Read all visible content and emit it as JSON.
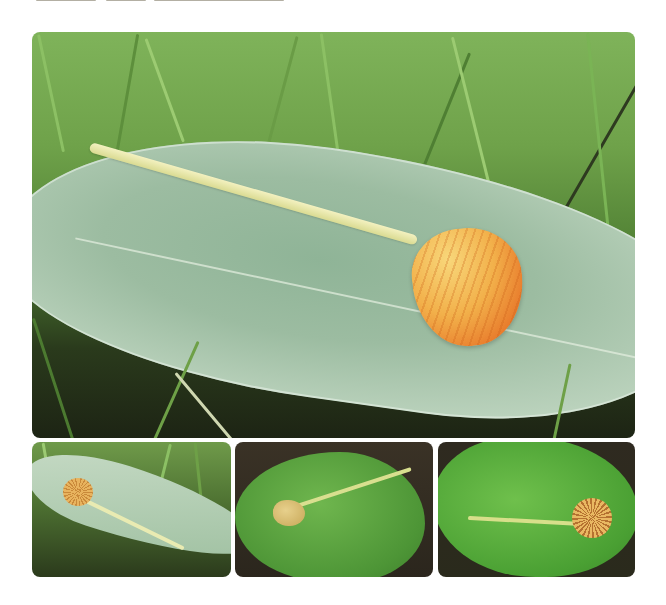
{
  "page": {
    "background": "#ffffff",
    "top_text_cropped": true
  },
  "figure": {
    "main_photo": {
      "subject": "orange-yellow mushroom on a pale grey-green hairy leaf in grass",
      "cap_color": "#f2b04a",
      "stem_color": "#e6e6aa",
      "leaf_color": "#a9c6ad",
      "grass_color": "#6fa24a"
    },
    "thumbnails": [
      {
        "subject": "mushroom on pale grey-green leaf in grass, gill view",
        "leaf_color": "#b3ceb2"
      },
      {
        "subject": "mushroom on bright green crinkled leaf",
        "leaf_color": "#5aa640"
      },
      {
        "subject": "mushroom with striped gills on bright green leaf",
        "leaf_color": "#55ac3c"
      }
    ]
  }
}
